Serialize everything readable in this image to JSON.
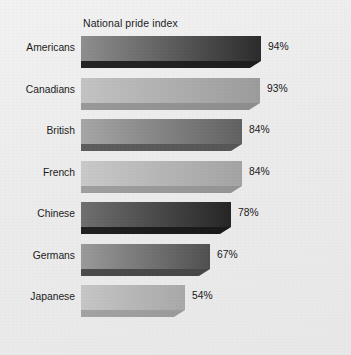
{
  "chart_data": {
    "type": "bar",
    "orientation": "horizontal",
    "title": "National pride index",
    "xlabel": "",
    "ylabel": "",
    "xlim": [
      0,
      100
    ],
    "grid": false,
    "legend": false,
    "value_suffix": "%",
    "categories": [
      "Americans",
      "Canadians",
      "British",
      "French",
      "Chinese",
      "Germans",
      "Japanese"
    ],
    "values": [
      94,
      93,
      84,
      84,
      78,
      67,
      54
    ],
    "value_labels": [
      "94%",
      "93%",
      "84%",
      "84%",
      "78%",
      "67%",
      "54%"
    ],
    "bars": [
      {
        "label": "Americans",
        "value": 94,
        "value_label": "94%",
        "tone": "dark",
        "fill_start": "#8e8e8e",
        "fill_end": "#2a2a2a",
        "side": "#1b1b1b",
        "bottom": "#242424"
      },
      {
        "label": "Canadians",
        "value": 93,
        "value_label": "93%",
        "tone": "light",
        "fill_start": "#c3c3c3",
        "fill_end": "#9b9b9b",
        "side": "#8c8c8c",
        "bottom": "#989898"
      },
      {
        "label": "British",
        "value": 84,
        "value_label": "84%",
        "tone": "mid",
        "fill_start": "#a6a6a6",
        "fill_end": "#606060",
        "side": "#555555",
        "bottom": "#5c5c5c"
      },
      {
        "label": "French",
        "value": 84,
        "value_label": "84%",
        "tone": "light",
        "fill_start": "#c9c9c9",
        "fill_end": "#a3a3a3",
        "side": "#939393",
        "bottom": "#9e9e9e"
      },
      {
        "label": "Chinese",
        "value": 78,
        "value_label": "78%",
        "tone": "dark",
        "fill_start": "#6e6e6e",
        "fill_end": "#242424",
        "side": "#171717",
        "bottom": "#1f1f1f"
      },
      {
        "label": "Germans",
        "value": 67,
        "value_label": "67%",
        "tone": "mid",
        "fill_start": "#9a9a9a",
        "fill_end": "#4f4f4f",
        "side": "#454545",
        "bottom": "#4a4a4a"
      },
      {
        "label": "Japanese",
        "value": 54,
        "value_label": "54%",
        "tone": "light",
        "fill_start": "#c6c6c6",
        "fill_end": "#a8a8a8",
        "side": "#9a9a9a",
        "bottom": "#a2a2a2"
      }
    ]
  },
  "colors": {
    "background": "#ececed",
    "text": "#1a1a1a",
    "title_text": "#1b1b1b"
  }
}
